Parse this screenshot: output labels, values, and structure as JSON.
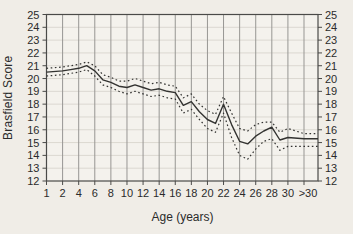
{
  "figure": {
    "y_axis_title": "Brasfield Score",
    "x_axis_title": "Age (years)",
    "background_color": "#f0ede7",
    "plot_background_color": "#f4f2ed",
    "vertical_gridline_color": "#979693",
    "horizontal_gridline_color": "#dbd8d1",
    "axis_color": "#4a4a48",
    "line_color": "#333331",
    "tick_label_color": "#2b2b2b"
  },
  "chart_data": {
    "type": "line",
    "title": "",
    "xlabel": "Age (years)",
    "ylabel": "Brasfield Score",
    "ylim": [
      12,
      25
    ],
    "y_tick_labels": [
      "25",
      "24",
      "23",
      "22",
      "21",
      "20",
      "19",
      "18",
      "17",
      "16",
      "15",
      "14",
      "13",
      "12"
    ],
    "y_axis_sides": [
      "left",
      "right"
    ],
    "x_tick_labels": [
      "1",
      "2",
      "4",
      "6",
      "8",
      "10",
      "12",
      "14",
      "16",
      "18",
      "20",
      "22",
      "24",
      "26",
      "28",
      "30",
      ">30"
    ],
    "x_categories": [
      "1",
      "2",
      "3",
      "4",
      "5",
      "6",
      "7",
      "8",
      "9",
      "10",
      "11",
      "12",
      "13",
      "14",
      "15",
      "16",
      "17",
      "18",
      "19",
      "20",
      "21",
      "22",
      "23",
      "24",
      "25",
      "26",
      "27",
      "28",
      "29",
      "30",
      ">30"
    ],
    "gridlines": {
      "vertical": true,
      "horizontal": true
    },
    "legend": "none",
    "series": [
      {
        "name": "mean",
        "style": "solid",
        "values": [
          20.5,
          20.6,
          20.7,
          20.8,
          21.0,
          20.6,
          19.9,
          19.7,
          19.4,
          19.3,
          19.5,
          19.3,
          19.1,
          19.2,
          19.0,
          18.9,
          17.9,
          18.2,
          17.4,
          16.8,
          16.5,
          18.0,
          16.4,
          15.1,
          14.9,
          15.5,
          15.9,
          16.2,
          15.2,
          15.4,
          15.3
        ]
      },
      {
        "name": "upper-bound",
        "style": "dotted",
        "values": [
          20.8,
          20.9,
          21.0,
          21.1,
          21.3,
          21.0,
          20.3,
          20.1,
          19.8,
          19.8,
          20.0,
          19.8,
          19.6,
          19.7,
          19.5,
          19.4,
          18.5,
          18.8,
          18.0,
          17.5,
          17.2,
          18.6,
          17.3,
          16.1,
          15.9,
          16.4,
          16.6,
          16.6,
          15.8,
          16.1,
          15.7
        ]
      },
      {
        "name": "lower-bound",
        "style": "dotted",
        "values": [
          20.2,
          20.3,
          20.4,
          20.5,
          20.7,
          20.2,
          19.5,
          19.3,
          19.0,
          18.8,
          19.0,
          18.8,
          18.6,
          18.7,
          18.5,
          18.4,
          17.3,
          17.6,
          16.8,
          16.1,
          15.8,
          17.3,
          15.4,
          14.0,
          13.7,
          14.5,
          15.1,
          15.3,
          14.4,
          14.7,
          14.7
        ]
      }
    ]
  }
}
